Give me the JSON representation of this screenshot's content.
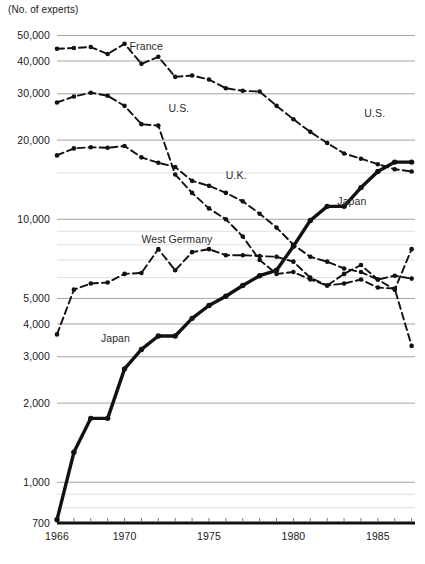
{
  "chart_data": {
    "type": "line",
    "title": "(No. of experts)",
    "xlabel": "",
    "ylabel": "No. of experts",
    "yscale": "log",
    "ylim": [
      700,
      52000
    ],
    "xlim": [
      1966,
      1987.2
    ],
    "grid": true,
    "legend_position": "inline-annotations",
    "ytick_labels": [
      "50,000",
      "40,000",
      "30,000",
      "20,000",
      "10,000",
      "5,000",
      "4,000",
      "3,000",
      "2,000",
      "1,000",
      "700"
    ],
    "ytick_values": [
      50000,
      40000,
      30000,
      20000,
      10000,
      5000,
      4000,
      3000,
      2000,
      1000,
      700
    ],
    "minor_gridline_values": [
      15000,
      9000,
      8000,
      7000,
      6000,
      900,
      800
    ],
    "xtick_labels": [
      "1966",
      "1970",
      "1975",
      "1980",
      "1985"
    ],
    "xtick_values": [
      1966,
      1970,
      1975,
      1980,
      1985
    ],
    "x_minor_ticks_every": 1,
    "series": [
      {
        "name": "France",
        "style": "dashed",
        "label": "France",
        "label_x": 1970.3,
        "label_y": 44000,
        "x": [
          1966,
          1967,
          1968,
          1969,
          1970,
          1971,
          1972,
          1973,
          1974,
          1975,
          1976,
          1977,
          1978,
          1979,
          1980,
          1981,
          1982,
          1983,
          1984,
          1985,
          1986,
          1987
        ],
        "values": [
          44500,
          44800,
          45200,
          42500,
          46500,
          39000,
          41500,
          34800,
          35200,
          34000,
          31500,
          30800,
          30600,
          27000,
          24000,
          21500,
          19500,
          17800,
          17000,
          16200,
          15500,
          15200
        ]
      },
      {
        "name": "U.S.",
        "style": "dashed",
        "label": "U.S.",
        "label_x": 1972.6,
        "label_y": 25500,
        "label2": "U.S.",
        "label2_x": 1984.2,
        "label2_y": 24500,
        "x": [
          1966,
          1967,
          1968,
          1969,
          1970,
          1971,
          1972,
          1973,
          1974,
          1975,
          1976,
          1977,
          1978,
          1979,
          1980,
          1981,
          1982,
          1983,
          1984,
          1985,
          1986,
          1987
        ],
        "values": [
          27800,
          29300,
          30300,
          29500,
          27000,
          23000,
          22700,
          14800,
          12600,
          11000,
          10000,
          8600,
          7000,
          6200,
          6300,
          5900,
          5600,
          6200,
          6700,
          5900,
          5400,
          7700
        ]
      },
      {
        "name": "U.K.",
        "style": "dashed",
        "label": "U.K.",
        "label_x": 1976.0,
        "label_y": 14200,
        "x": [
          1966,
          1967,
          1968,
          1969,
          1970,
          1971,
          1972,
          1973,
          1974,
          1975,
          1976,
          1977,
          1978,
          1979,
          1980,
          1981,
          1982,
          1983,
          1984,
          1985,
          1986,
          1987
        ],
        "values": [
          17500,
          18600,
          18800,
          18700,
          19000,
          17200,
          16400,
          15800,
          14000,
          13400,
          12600,
          11700,
          10500,
          9300,
          8000,
          7200,
          6900,
          6500,
          6300,
          5900,
          6100,
          5950
        ]
      },
      {
        "name": "West Germany",
        "style": "dashed",
        "label": "West Germany",
        "label_x": 1971.0,
        "label_y": 8100,
        "x": [
          1966,
          1967,
          1968,
          1969,
          1970,
          1971,
          1972,
          1973,
          1974,
          1975,
          1976,
          1977,
          1978,
          1979,
          1980,
          1981,
          1982,
          1983,
          1984,
          1985,
          1986,
          1987
        ],
        "values": [
          3650,
          5400,
          5700,
          5750,
          6200,
          6250,
          7700,
          6400,
          7500,
          7700,
          7300,
          7300,
          7250,
          7200,
          6900,
          6000,
          5600,
          5700,
          5900,
          5500,
          5450,
          3300
        ]
      },
      {
        "name": "Japan",
        "style": "solid",
        "label": "Japan",
        "label_x": 1968.6,
        "label_y": 3400,
        "label2": "Japan",
        "label2_x": 1982.6,
        "label2_y": 11300,
        "x": [
          1966,
          1967,
          1968,
          1969,
          1970,
          1971,
          1972,
          1973,
          1974,
          1975,
          1976,
          1977,
          1978,
          1979,
          1980,
          1981,
          1982,
          1983,
          1984,
          1985,
          1986,
          1987
        ],
        "values": [
          720,
          1300,
          1750,
          1750,
          2700,
          3200,
          3600,
          3600,
          4200,
          4700,
          5100,
          5600,
          6100,
          6400,
          7900,
          9900,
          11200,
          11200,
          13200,
          15200,
          16500,
          16500
        ]
      }
    ]
  }
}
